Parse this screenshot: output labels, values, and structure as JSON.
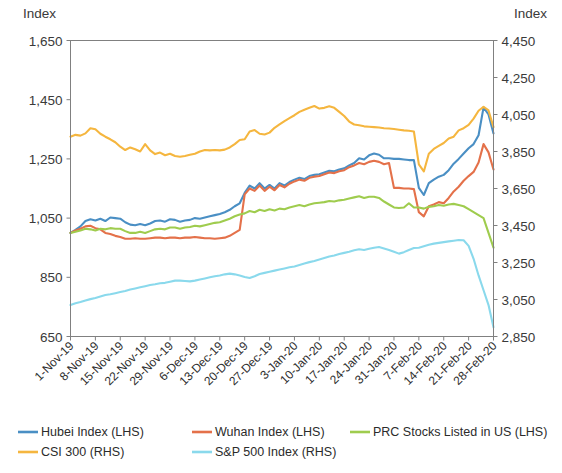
{
  "chart_data": {
    "type": "line",
    "title": "",
    "subtitle": "",
    "xlabel": "",
    "left_axis": {
      "label": "Index",
      "ticks": [
        "650",
        "850",
        "1,050",
        "1,250",
        "1,450",
        "1,650"
      ],
      "tick_values": [
        650,
        850,
        1050,
        1250,
        1450,
        1650
      ],
      "ylim": [
        650,
        1650
      ]
    },
    "right_axis": {
      "label": "Index",
      "ticks": [
        "2,850",
        "3,050",
        "3,250",
        "3,450",
        "3,650",
        "3,850",
        "4,050",
        "4,250",
        "4,450"
      ],
      "tick_values": [
        2850,
        3050,
        3250,
        3450,
        3650,
        3850,
        4050,
        4250,
        4450
      ],
      "ylim": [
        2850,
        4450
      ]
    },
    "grid": false,
    "legend_position": "bottom-left",
    "x_tick_labels": [
      "1-Nov-19",
      "8-Nov-19",
      "15-Nov-19",
      "22-Nov-19",
      "29-Nov-19",
      "6-Dec-19",
      "13-Dec-19",
      "20-Dec-19",
      "27-Dec-19",
      "3-Jan-20",
      "10-Jan-20",
      "17-Jan-20",
      "24-Jan-20",
      "31-Jan-20",
      "7-Feb-20",
      "14-Feb-20",
      "21-Feb-20",
      "28-Feb-20"
    ],
    "x_tick_positions": [
      0,
      5,
      10,
      15,
      20,
      25,
      30,
      35,
      40,
      45,
      50,
      55,
      60,
      65,
      70,
      75,
      80,
      85
    ],
    "n_points": 86,
    "series": [
      {
        "name": "Hubei Index (LHS)",
        "axis": "left",
        "color": "#4a8fc4",
        "values": [
          1000,
          1010,
          1022,
          1040,
          1046,
          1042,
          1048,
          1040,
          1052,
          1050,
          1048,
          1036,
          1028,
          1026,
          1030,
          1026,
          1032,
          1040,
          1042,
          1038,
          1046,
          1044,
          1038,
          1042,
          1044,
          1050,
          1048,
          1052,
          1056,
          1060,
          1064,
          1070,
          1078,
          1090,
          1100,
          1135,
          1160,
          1150,
          1168,
          1150,
          1162,
          1150,
          1168,
          1160,
          1172,
          1180,
          1186,
          1182,
          1192,
          1196,
          1198,
          1204,
          1210,
          1208,
          1214,
          1218,
          1228,
          1236,
          1252,
          1248,
          1262,
          1268,
          1264,
          1252,
          1252,
          1250,
          1250,
          1248,
          1246,
          1246,
          1152,
          1128,
          1168,
          1180,
          1190,
          1196,
          1212,
          1234,
          1250,
          1268,
          1286,
          1300,
          1330,
          1424,
          1400,
          1336
        ]
      },
      {
        "name": "Wuhan Index (LHS)",
        "axis": "left",
        "color": "#e4714a",
        "values": [
          1000,
          1008,
          1014,
          1022,
          1024,
          1016,
          1012,
          1000,
          996,
          990,
          986,
          980,
          980,
          982,
          980,
          980,
          982,
          984,
          984,
          982,
          984,
          984,
          982,
          984,
          984,
          986,
          984,
          982,
          982,
          980,
          982,
          984,
          990,
          1000,
          1010,
          1130,
          1150,
          1142,
          1160,
          1142,
          1156,
          1144,
          1162,
          1154,
          1166,
          1174,
          1180,
          1176,
          1186,
          1190,
          1192,
          1198,
          1204,
          1202,
          1208,
          1212,
          1222,
          1228,
          1236,
          1232,
          1240,
          1244,
          1240,
          1232,
          1236,
          1152,
          1152,
          1150,
          1150,
          1148,
          1070,
          1056,
          1090,
          1096,
          1104,
          1100,
          1118,
          1140,
          1156,
          1176,
          1192,
          1206,
          1238,
          1300,
          1272,
          1214
        ]
      },
      {
        "name": "PRC Stocks Listed in US (LHS)",
        "axis": "left",
        "color": "#9fcc4e",
        "values": [
          1000,
          1004,
          1008,
          1014,
          1012,
          1008,
          1014,
          1012,
          1016,
          1014,
          1014,
          1006,
          1000,
          1000,
          1004,
          1000,
          1006,
          1012,
          1014,
          1012,
          1018,
          1018,
          1014,
          1018,
          1020,
          1024,
          1022,
          1026,
          1030,
          1034,
          1036,
          1042,
          1048,
          1056,
          1062,
          1066,
          1074,
          1070,
          1078,
          1074,
          1080,
          1076,
          1082,
          1080,
          1086,
          1090,
          1094,
          1090,
          1096,
          1100,
          1102,
          1104,
          1108,
          1106,
          1110,
          1112,
          1116,
          1120,
          1124,
          1118,
          1122,
          1122,
          1118,
          1106,
          1096,
          1086,
          1084,
          1086,
          1100,
          1086,
          1086,
          1082,
          1088,
          1090,
          1094,
          1092,
          1096,
          1098,
          1094,
          1090,
          1080,
          1070,
          1060,
          1050,
          1000,
          950
        ]
      },
      {
        "name": "CSI 300 (RHS)",
        "axis": "right",
        "color": "#f5b63f",
        "values": [
          3930,
          3940,
          3936,
          3948,
          3976,
          3970,
          3946,
          3930,
          3916,
          3900,
          3876,
          3858,
          3872,
          3862,
          3850,
          3890,
          3856,
          3836,
          3844,
          3830,
          3838,
          3826,
          3822,
          3826,
          3832,
          3838,
          3850,
          3858,
          3856,
          3858,
          3856,
          3860,
          3872,
          3890,
          3912,
          3916,
          3958,
          3966,
          3946,
          3942,
          3952,
          3978,
          3996,
          4014,
          4030,
          4046,
          4064,
          4076,
          4086,
          4096,
          4082,
          4086,
          4094,
          4086,
          4064,
          4042,
          4012,
          3996,
          3992,
          3986,
          3984,
          3982,
          3980,
          3976,
          3974,
          3972,
          3968,
          3964,
          3962,
          3958,
          3780,
          3742,
          3838,
          3864,
          3880,
          3896,
          3920,
          3930,
          3964,
          3976,
          3994,
          4028,
          4070,
          4092,
          4072,
          3982
        ]
      },
      {
        "name": "S&P 500 Index (RHS)",
        "axis": "right",
        "color": "#8ad9ec",
        "values": [
          3020,
          3030,
          3036,
          3044,
          3052,
          3058,
          3066,
          3074,
          3078,
          3084,
          3090,
          3096,
          3104,
          3110,
          3116,
          3122,
          3128,
          3132,
          3138,
          3140,
          3146,
          3152,
          3152,
          3150,
          3148,
          3152,
          3158,
          3164,
          3170,
          3176,
          3180,
          3186,
          3190,
          3186,
          3180,
          3172,
          3166,
          3176,
          3188,
          3194,
          3200,
          3206,
          3212,
          3218,
          3224,
          3228,
          3236,
          3244,
          3252,
          3258,
          3266,
          3274,
          3282,
          3288,
          3296,
          3302,
          3308,
          3316,
          3322,
          3318,
          3324,
          3330,
          3334,
          3326,
          3318,
          3308,
          3298,
          3306,
          3318,
          3328,
          3330,
          3338,
          3346,
          3352,
          3356,
          3360,
          3364,
          3368,
          3372,
          3370,
          3340,
          3270,
          3180,
          3100,
          3020,
          2900
        ]
      }
    ]
  },
  "legend": {
    "row1": [
      {
        "label": "Hubei Index (LHS)",
        "color": "#4a8fc4"
      },
      {
        "label": "Wuhan Index (LHS)",
        "color": "#e4714a"
      },
      {
        "label": "PRC Stocks Listed in US (LHS)",
        "color": "#9fcc4e"
      }
    ],
    "row2": [
      {
        "label": "CSI 300 (RHS)",
        "color": "#f5b63f"
      },
      {
        "label": "S&P 500 Index (RHS)",
        "color": "#8ad9ec"
      }
    ]
  }
}
